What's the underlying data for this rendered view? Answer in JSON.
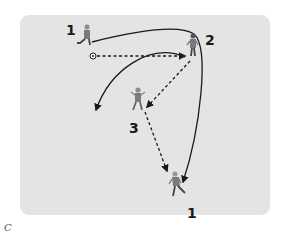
{
  "diagram": {
    "type": "soccer-drill",
    "caption": "C",
    "background_color": "#e4e4e4",
    "players": [
      {
        "id": "p1-start",
        "label": "1",
        "x": 87,
        "y": 36,
        "role": "passer"
      },
      {
        "id": "p2",
        "label": "2",
        "x": 193,
        "y": 49,
        "role": "receiver"
      },
      {
        "id": "p3",
        "label": "3",
        "x": 138,
        "y": 102,
        "role": "receiver"
      },
      {
        "id": "p1-end",
        "label": "1",
        "x": 177,
        "y": 187,
        "role": "runner"
      }
    ],
    "ball": {
      "x": 93,
      "y": 56
    },
    "paths": [
      {
        "type": "pass",
        "style": "dashed",
        "from": "ball",
        "to": "p2"
      },
      {
        "type": "pass",
        "style": "dashed",
        "from": "p2",
        "to": "p3"
      },
      {
        "type": "pass",
        "style": "dashed",
        "from": "p3",
        "to": "p1-end"
      },
      {
        "type": "run",
        "style": "solid",
        "from": "p1-start",
        "to": "p1-end",
        "via": "behind p2"
      },
      {
        "type": "run",
        "style": "solid",
        "from": "p2",
        "to": "left-space",
        "curved": true
      }
    ]
  }
}
